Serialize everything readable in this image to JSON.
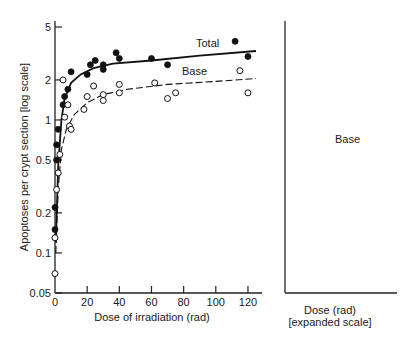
{
  "chart_data": [
    {
      "type": "scatter",
      "title": "",
      "xlabel": "Dose of irradiation (rad)",
      "ylabel": "Apoptoses per crypt section [log scale]",
      "yscale": "log",
      "xlim": [
        0,
        125
      ],
      "ylim": [
        0.05,
        5
      ],
      "x_ticks": [
        0,
        20,
        40,
        60,
        80,
        100,
        120
      ],
      "y_ticks": [
        0.05,
        0.1,
        0.2,
        0.5,
        1,
        2,
        5
      ],
      "y_tick_labels": [
        "0.05",
        "0.1",
        "0.2",
        "0.5",
        "1",
        "2",
        "5"
      ],
      "grid": false,
      "series": [
        {
          "name": "Total",
          "marker": "filled-circle",
          "line": "solid",
          "points": [
            [
              0,
              0.15
            ],
            [
              0,
              0.22
            ],
            [
              1,
              0.5
            ],
            [
              1,
              0.65
            ],
            [
              2,
              0.85
            ],
            [
              5,
              1.3
            ],
            [
              6,
              1.5
            ],
            [
              8,
              1.7
            ],
            [
              10,
              2.3
            ],
            [
              20,
              2.2
            ],
            [
              22,
              2.6
            ],
            [
              25,
              2.8
            ],
            [
              30,
              2.6
            ],
            [
              30,
              2.4
            ],
            [
              38,
              3.2
            ],
            [
              40,
              2.9
            ],
            [
              60,
              2.9
            ],
            [
              70,
              2.6
            ],
            [
              112,
              3.9
            ],
            [
              120,
              3.0
            ]
          ],
          "curve": [
            [
              0.5,
              0.12
            ],
            [
              2,
              0.45
            ],
            [
              4,
              1.0
            ],
            [
              6,
              1.45
            ],
            [
              10,
              1.9
            ],
            [
              16,
              2.2
            ],
            [
              24,
              2.45
            ],
            [
              36,
              2.65
            ],
            [
              60,
              2.8
            ],
            [
              90,
              3.05
            ],
            [
              125,
              3.3
            ]
          ]
        },
        {
          "name": "Base",
          "marker": "open-circle",
          "line": "dashed",
          "points": [
            [
              0,
              0.07
            ],
            [
              0,
              0.13
            ],
            [
              1,
              0.3
            ],
            [
              2,
              0.4
            ],
            [
              3,
              0.55
            ],
            [
              5,
              2.0
            ],
            [
              6,
              1.05
            ],
            [
              8,
              1.3
            ],
            [
              9,
              0.9
            ],
            [
              10,
              0.85
            ],
            [
              18,
              1.2
            ],
            [
              20,
              1.5
            ],
            [
              24,
              1.8
            ],
            [
              30,
              1.4
            ],
            [
              30,
              1.55
            ],
            [
              40,
              1.85
            ],
            [
              40,
              1.6
            ],
            [
              62,
              1.9
            ],
            [
              70,
              1.45
            ],
            [
              75,
              1.6
            ],
            [
              115,
              2.35
            ],
            [
              120,
              1.6
            ]
          ],
          "curve": [
            [
              0.5,
              0.1
            ],
            [
              2,
              0.3
            ],
            [
              4,
              0.6
            ],
            [
              7,
              0.85
            ],
            [
              12,
              1.1
            ],
            [
              20,
              1.35
            ],
            [
              30,
              1.55
            ],
            [
              45,
              1.7
            ],
            [
              70,
              1.85
            ],
            [
              100,
              1.95
            ],
            [
              125,
              2.05
            ]
          ]
        }
      ]
    },
    {
      "type": "scatter",
      "title": "",
      "xlabel": "Dose (rad)",
      "xlabel_note": "[expanded scale]",
      "yscale": "log",
      "xlim": [
        0,
        14
      ],
      "ylim": [
        0.05,
        5
      ],
      "x_ticks": [
        0,
        4,
        8,
        12
      ],
      "x_minor_ticks": [
        2,
        6,
        10
      ],
      "grid": false,
      "series": [
        {
          "name": "Base",
          "marker": "open-circle",
          "line": "dashed",
          "points": [
            [
              0,
              0.07
            ],
            [
              0.5,
              0.13
            ],
            [
              1.5,
              0.35
            ],
            [
              3,
              0.26
            ],
            [
              5,
              0.55
            ],
            [
              6,
              1.05
            ],
            [
              9,
              0.95
            ],
            [
              10,
              0.9
            ],
            [
              12,
              1.2
            ]
          ],
          "curve": [
            [
              0,
              0.08
            ],
            [
              0.5,
              0.12
            ],
            [
              1,
              0.19
            ],
            [
              2,
              0.3
            ],
            [
              3,
              0.45
            ],
            [
              4,
              0.6
            ],
            [
              5,
              0.75
            ],
            [
              6,
              0.85
            ],
            [
              8,
              1.0
            ],
            [
              10,
              1.1
            ],
            [
              12,
              1.2
            ],
            [
              13,
              1.25
            ]
          ]
        }
      ]
    }
  ],
  "labels": {
    "ylabel": "Apoptoses per crypt section [log scale]",
    "left_xlabel": "Dose of irradiation (rad)",
    "right_xlabel": "Dose (rad)",
    "right_xlabel_note": "[expanded scale]",
    "total": "Total",
    "base_left": "Base",
    "base_right": "Base"
  }
}
